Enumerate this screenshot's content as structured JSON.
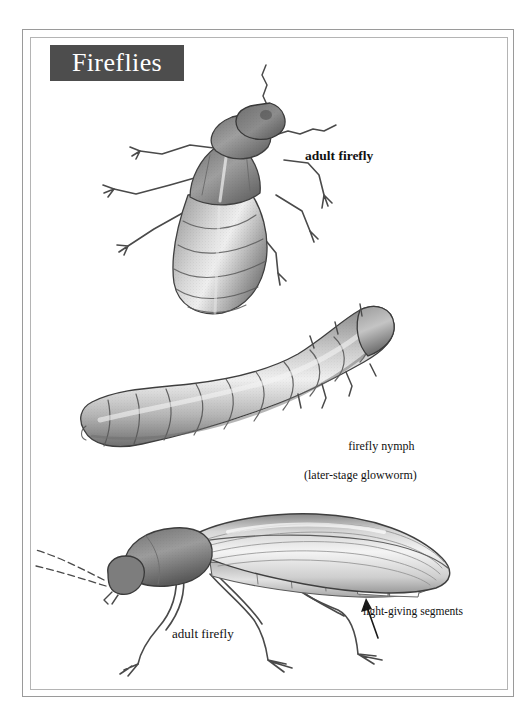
{
  "page": {
    "title": "Fireflies",
    "background_color": "#ffffff",
    "frame_color": "#9a9a9a",
    "banner_color": "#4d4d4d",
    "banner_text_color": "#ffffff",
    "ink_color": "#111111"
  },
  "labels": {
    "adult_top": "adult firefly",
    "nymph_line1": "firefly nymph",
    "nymph_line2": "(later-stage glowworm)",
    "adult_bottom": "adult firefly",
    "light_segments": "light-giving segments"
  },
  "illustrations": [
    {
      "id": "adult-dorsal",
      "name": "adult-firefly-dorsal-illustration",
      "caption": "adult firefly",
      "medium": "graphite pencil drawing",
      "view": "dorsal",
      "orientation": "head upper-right, abdomen lower-left"
    },
    {
      "id": "firefly-nymph",
      "name": "firefly-nymph-illustration",
      "caption": "firefly nymph (later-stage glowworm)",
      "medium": "graphite pencil drawing",
      "view": "dorsal",
      "orientation": "head upper-right, tail lower-left",
      "segment_count": 11
    },
    {
      "id": "adult-lateral",
      "name": "adult-firefly-lateral-illustration",
      "caption": "adult firefly",
      "medium": "graphite pencil drawing",
      "view": "lateral",
      "orientation": "head left, abdomen right",
      "annotation": "light-giving segments"
    }
  ]
}
